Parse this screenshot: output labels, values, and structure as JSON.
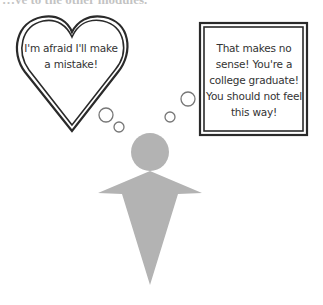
{
  "header": {
    "partial_text": "…ve to the other modules."
  },
  "thought_bubbles": {
    "heart": {
      "shape": "heart",
      "text": "I'm afraid I'll make a mistake!",
      "lines": [
        "I'm afraid I'll make",
        "a mistake!"
      ]
    },
    "box": {
      "shape": "double-border-rectangle",
      "text": "That makes no sense! You're a college graduate! You should not feel this way!",
      "lines": [
        "That makes no",
        "sense! You're a",
        "college graduate!",
        "You should not feel",
        "this way!"
      ]
    }
  },
  "figure": {
    "color": "#b3b3b3"
  },
  "colors": {
    "outline": "#2a2a2a",
    "figure": "#b3b3b3",
    "bubble_circle": "#777777",
    "text": "#333333"
  }
}
